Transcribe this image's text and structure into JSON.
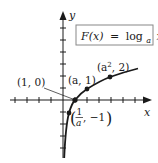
{
  "diagram": {
    "function_label": {
      "lhs": "F(x)",
      "equals": "=",
      "log": "log",
      "base": "a",
      "arg": "x"
    },
    "axes": {
      "x_label": "x",
      "y_label": "y"
    },
    "points": [
      {
        "label": "(1, 0)",
        "x": "1",
        "y": "0"
      },
      {
        "label": "(a, 1)",
        "x": "a",
        "y": "1"
      },
      {
        "label": "(a², 2)",
        "x": "a²",
        "y": "2"
      },
      {
        "label": "(1/a, −1)",
        "x": "1/a",
        "y": "−1"
      }
    ],
    "labels": {
      "p1": "(1, 0)",
      "p2": "(a, 1)",
      "p3_open": "(a",
      "p3_sup": "2",
      "p3_close": ", 2)",
      "p4_num": "1",
      "p4_den": "a",
      "p4_rest": ", −1"
    },
    "colors": {
      "ink": "#1a1a1a",
      "box_border": "#888888"
    }
  }
}
